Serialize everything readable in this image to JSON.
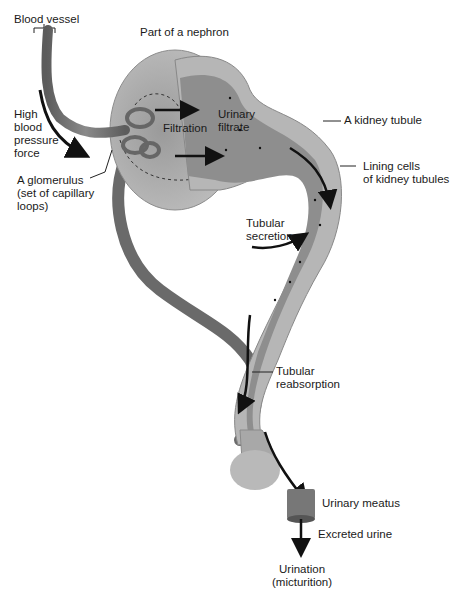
{
  "title_fragment": "...y ... ...y ...y ...",
  "labels": {
    "blood_vessel": "Blood vessel",
    "part_of_nephron": "Part of a nephron",
    "high_blood_pressure": "High\nblood\npressure\nforce",
    "glomerulus": "A glomerulus\n(set of capillary\nloops)",
    "filtration": "Filtration",
    "urinary_filtrate": "Urinary\nfiltrate",
    "kidney_tubule": "A kidney tubule",
    "lining_cells": "Lining cells\nof kidney tubules",
    "tubular_secretion": "Tubular\nsecretion",
    "tubular_reabsorption": "Tubular\nreabsorption",
    "urinary_meatus": "Urinary meatus",
    "excreted_urine": "Excreted urine",
    "urination": "Urination\n(micturition)"
  },
  "colors": {
    "vessel": "#6e6e6e",
    "capsule": "#a8a8a8",
    "capsule_dark": "#7a7a7a",
    "tubule_outer": "#b5b5b5",
    "tubule_inner": "#8a8a8a",
    "filtrate": "#8f8f8f",
    "arrow": "#111111",
    "text": "#1a1a1a"
  }
}
